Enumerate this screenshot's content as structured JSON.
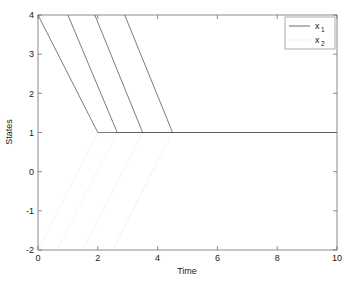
{
  "chart_data": {
    "type": "line",
    "title": "",
    "xlabel": "Time",
    "ylabel": "States",
    "xlim": [
      0,
      10
    ],
    "ylim": [
      -2,
      4
    ],
    "xticks": [
      0,
      2,
      4,
      6,
      8,
      10
    ],
    "yticks": [
      -2,
      -1,
      0,
      1,
      2,
      3,
      4
    ],
    "xtick_labels": [
      "0",
      "2",
      "4",
      "6",
      "8",
      "10"
    ],
    "ytick_labels": [
      "-2",
      "-1",
      "0",
      "1",
      "2",
      "3",
      "4"
    ],
    "grid": false,
    "legend_position": "upper right",
    "legend": [
      {
        "base": "x",
        "sub": "1",
        "style": "solid"
      },
      {
        "base": "x",
        "sub": "2",
        "style": "dotted"
      }
    ],
    "series": [
      {
        "name": "x1",
        "style": "solid",
        "color": "#5a5a5a",
        "segments": [
          {
            "points": [
              [
                0.0,
                4.0
              ],
              [
                2.0,
                1.0
              ],
              [
                10.0,
                1.0
              ]
            ]
          },
          {
            "points": [
              [
                1.0,
                4.0
              ],
              [
                2.65,
                1.0
              ],
              [
                10.0,
                1.0
              ]
            ]
          },
          {
            "points": [
              [
                1.9,
                4.0
              ],
              [
                3.5,
                1.0
              ],
              [
                10.0,
                1.0
              ]
            ]
          },
          {
            "points": [
              [
                2.9,
                4.0
              ],
              [
                4.5,
                1.0
              ],
              [
                10.0,
                1.0
              ]
            ]
          }
        ]
      },
      {
        "name": "x2",
        "style": "dotted",
        "color": "#d8d8d8",
        "segments": [
          {
            "points": [
              [
                0.0,
                -2.0
              ],
              [
                2.0,
                1.0
              ],
              [
                10.0,
                1.0
              ]
            ]
          },
          {
            "points": [
              [
                0.65,
                -2.0
              ],
              [
                2.65,
                1.0
              ],
              [
                10.0,
                1.0
              ]
            ]
          },
          {
            "points": [
              [
                1.5,
                -2.0
              ],
              [
                3.5,
                1.0
              ],
              [
                10.0,
                1.0
              ]
            ]
          },
          {
            "points": [
              [
                2.5,
                -2.0
              ],
              [
                4.5,
                1.0
              ],
              [
                10.0,
                1.0
              ]
            ]
          }
        ]
      }
    ]
  },
  "axes": {
    "x_label": "Time",
    "y_label": "States"
  },
  "ticks": {
    "x": [
      "0",
      "2",
      "4",
      "6",
      "8",
      "10"
    ],
    "y": [
      "-2",
      "-1",
      "0",
      "1",
      "2",
      "3",
      "4"
    ]
  },
  "legend": {
    "entry1_base": "x",
    "entry1_sub": "1",
    "entry2_base": "x",
    "entry2_sub": "2"
  },
  "colors": {
    "x1": "#5a5a5a",
    "x2": "#d8d8d8",
    "axis": "#6e6e6e",
    "background": "#ffffff"
  }
}
